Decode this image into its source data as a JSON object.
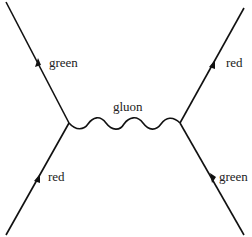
{
  "diagram": {
    "lines": [
      {
        "id": "top-left-quark",
        "label": "green"
      },
      {
        "id": "bottom-left-quark",
        "label": "red"
      },
      {
        "id": "top-right-quark",
        "label": "red"
      },
      {
        "id": "bottom-right-quark",
        "label": "green"
      }
    ],
    "propagator": {
      "label": "gluon"
    },
    "colors": {
      "line": "#111111",
      "text": "#222222",
      "background": "#ffffff"
    }
  }
}
